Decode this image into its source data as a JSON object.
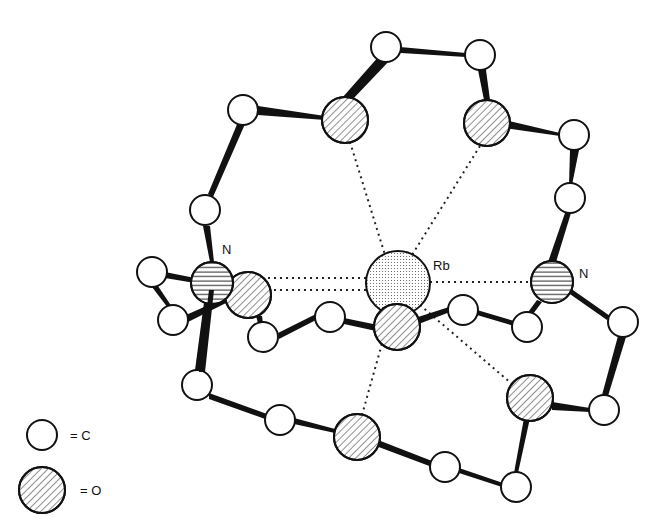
{
  "figure": {
    "labels": {
      "rb": "Rb",
      "n_left": "N",
      "n_right": "N"
    },
    "legend": [
      {
        "symbol": "open-circle",
        "text": "= C"
      },
      {
        "symbol": "hatched-circle",
        "text": "= O"
      }
    ],
    "atoms": {
      "carbon": [
        [
          386,
          47
        ],
        [
          480,
          55
        ],
        [
          243,
          110
        ],
        [
          574,
          135
        ],
        [
          205,
          210
        ],
        [
          570,
          198
        ],
        [
          152,
          272
        ],
        [
          173,
          320
        ],
        [
          263,
          337
        ],
        [
          330,
          317
        ],
        [
          463,
          310
        ],
        [
          527,
          327
        ],
        [
          623,
          322
        ],
        [
          197,
          385
        ],
        [
          280,
          420
        ],
        [
          604,
          410
        ],
        [
          445,
          467
        ],
        [
          516,
          487
        ]
      ],
      "oxygen": [
        [
          345,
          120
        ],
        [
          487,
          123
        ],
        [
          248,
          295
        ],
        [
          397,
          327
        ],
        [
          530,
          398
        ],
        [
          357,
          437
        ]
      ],
      "nitrogen": [
        [
          212,
          283
        ],
        [
          552,
          282
        ]
      ],
      "rubidium": [
        [
          398,
          283
        ]
      ]
    }
  }
}
